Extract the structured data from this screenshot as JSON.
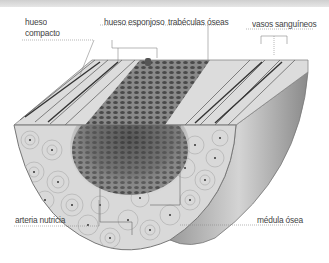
{
  "header": {
    "title": ""
  },
  "diagram": {
    "labels": {
      "hueso_compacto_line1": "hueso",
      "hueso_compacto_line2": "compacto",
      "hueso_esponjoso": "hueso esponjoso",
      "trabeculas_oseas": "trabéculas óseas",
      "vasos_sanguineos": "vasos sanguíneos",
      "arteria_nutricia": "arteria nutricia",
      "medula_osea": "médula ósea"
    },
    "colors": {
      "label_text": "#444444",
      "leader_line": "#888888",
      "bone_light": "#e6e6e6",
      "bone_mid": "#b5b5b5",
      "bone_dark": "#555555"
    }
  }
}
